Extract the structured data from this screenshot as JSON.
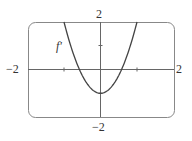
{
  "chart_data": {
    "type": "line",
    "title": "",
    "xlabel": "",
    "ylabel": "",
    "xlim": [
      -2,
      2
    ],
    "ylim": [
      -2,
      2
    ],
    "grid": false,
    "tick_labels": {
      "x_min": "−2",
      "x_max": "2",
      "y_min": "−2",
      "y_max": "2"
    },
    "series": [
      {
        "name": "f'",
        "expression": "3x^2 - 1",
        "x": [
          -1.0,
          -0.75,
          -0.577,
          -0.5,
          -0.25,
          0,
          0.25,
          0.5,
          0.577,
          0.75,
          1.0
        ],
        "y": [
          2.0,
          0.69,
          0.0,
          -0.25,
          -0.81,
          -1.0,
          -0.81,
          -0.25,
          0.0,
          0.69,
          2.0
        ]
      }
    ],
    "annotations": [
      {
        "text": "f'",
        "x": -1.2,
        "y": 1.0
      }
    ],
    "colors": {
      "curve": "#444444",
      "axes": "#666666",
      "frame": "#888888"
    }
  }
}
